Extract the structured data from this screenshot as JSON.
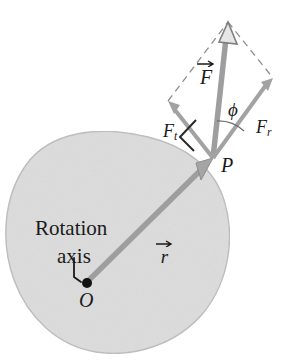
{
  "figure": {
    "kind": "physics-diagram",
    "background_color": "#ffffff",
    "body_fill_color": "#dcdcdc",
    "body_outline_color": "#b9b9b9",
    "vector_color": "#9a9a9a",
    "dashed_color": "#8c8c8c",
    "text_color": "#1a1a1a"
  },
  "labels": {
    "rotation_axis_line1": "Rotation",
    "rotation_axis_line2": "axis",
    "origin_point": "O",
    "application_point": "P",
    "position_vector": "r",
    "force_vector": "F",
    "tangential_component_base": "F",
    "tangential_component_sub": "t",
    "radial_component_base": "F",
    "radial_component_sub": "r",
    "angle": "ϕ"
  },
  "elements": {
    "body_blob_name": "rigid-body-blob",
    "right_angle_marker": "right-angle-marker",
    "origin_dot": "origin-dot",
    "leader_line": "rotation-axis-leader-line",
    "parallelogram": "force-parallelogram-dashed"
  },
  "geometry": {
    "origin_O": [
      86,
      283
    ],
    "point_P": [
      213,
      158
    ],
    "force_tip": [
      228,
      22
    ],
    "tangential_tip": [
      168,
      101
    ],
    "radial_tip": [
      273,
      78
    ],
    "parallelogram_apex": [
      228,
      22
    ]
  }
}
